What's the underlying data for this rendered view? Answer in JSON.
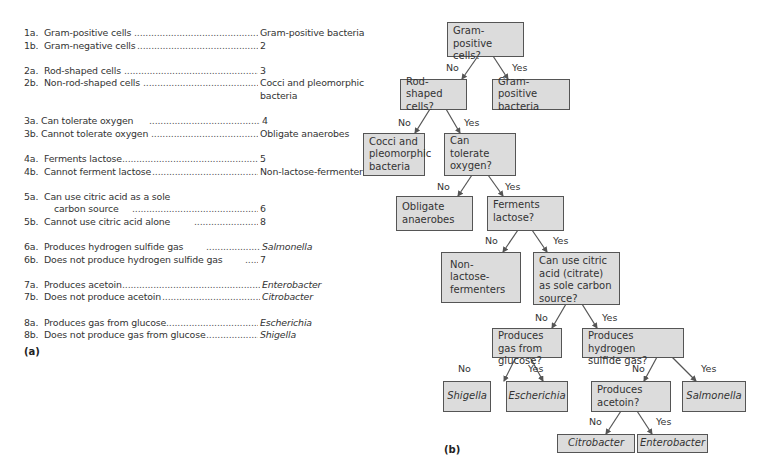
{
  "key": {
    "panel_label": "(a)",
    "couplets": [
      {
        "label": "1a.",
        "text": "Gram-positive cells",
        "result": "Gram-positive bacteria",
        "italic": false
      },
      {
        "label": "1b.",
        "text": "Gram-negative cells",
        "result": "2",
        "italic": false
      },
      {
        "label": "2a.",
        "text": "Rod-shaped cells",
        "result": "3",
        "italic": false
      },
      {
        "label": "2b.",
        "text": "Non-rod-shaped cells",
        "result": "Cocci and pleomorphic",
        "result_cont": "bacteria",
        "italic": false
      },
      {
        "label": "3a.",
        "text": "Can tolerate oxygen",
        "result": "4",
        "italic": false
      },
      {
        "label": "3b.",
        "text": "Cannot tolerate oxygen",
        "result": "Obligate anaerobes",
        "italic": false
      },
      {
        "label": "4a.",
        "text": "Ferments lactose",
        "result": "5",
        "italic": false
      },
      {
        "label": "4b.",
        "text": "Cannot ferment lactose",
        "result": "Non-lactose-fermenters",
        "italic": false
      },
      {
        "label": "5a.",
        "text": "Can use citric acid as a sole",
        "text_cont": "carbon source",
        "result": "6",
        "italic": false
      },
      {
        "label": "5b.",
        "text": "Cannot use citric acid alone",
        "result": "8",
        "italic": false
      },
      {
        "label": "6a.",
        "text": "Produces hydrogen sulfide gas",
        "result": "Salmonella",
        "italic": true
      },
      {
        "label": "6b.",
        "text": "Does not produce hydrogen sulfide gas",
        "result": "7",
        "italic": false
      },
      {
        "label": "7a.",
        "text": "Produces acetoin",
        "result": "Enterobacter",
        "italic": true
      },
      {
        "label": "7b.",
        "text": "Does not produce acetoin",
        "result": "Citrobacter",
        "italic": true
      },
      {
        "label": "8a.",
        "text": "Produces gas from glucose",
        "result": "Escherichia",
        "italic": true
      },
      {
        "label": "8b.",
        "text": "Does not produce gas from glucose",
        "result": "Shigella",
        "italic": true
      }
    ]
  },
  "tree": {
    "panel_label": "(b)",
    "edge_labels": {
      "no": "No",
      "yes": "Yes"
    },
    "nodes": {
      "gram_positive": "Gram-positive cells?",
      "gram_positive_bacteria": "Gram-positive bacteria",
      "rod_shaped": "Rod-shaped cells?",
      "cocci": "Cocci and pleomorphic bacteria",
      "tolerate_oxygen": "Can tolerate oxygen?",
      "obligate_anaerobes": "Obligate anaerobes",
      "ferments_lactose": "Ferments lactose?",
      "non_lactose": "Non-lactose-fermenters",
      "citric_acid": "Can use citric acid (citrate) as sole carbon source?",
      "gas_glucose": "Produces gas from glucose?",
      "hydrogen_sulfide": "Produces hydrogen sulfide gas?",
      "shigella": "Shigella",
      "escherichia": "Escherichia",
      "acetoin": "Produces acetoin?",
      "salmonella": "Salmonella",
      "citrobacter": "Citrobacter",
      "enterobacter": "Enterobacter"
    }
  }
}
